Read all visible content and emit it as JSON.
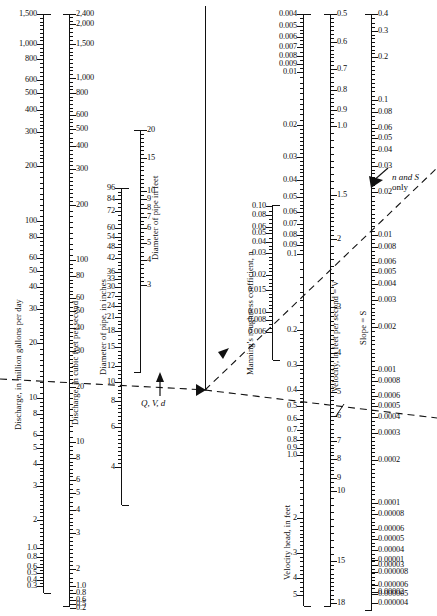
{
  "figure": {
    "type": "nomograph"
  },
  "pivot_line": {
    "x": 205,
    "y_top": 6,
    "y_bottom": 390
  },
  "annotations": [
    {
      "name": "qvd-label",
      "text": "Q, V, d",
      "x": 141,
      "y": 400
    },
    {
      "name": "n-and-s-label",
      "line1": "n and S",
      "line2": "only",
      "x": 392,
      "y": 178
    }
  ],
  "axes": [
    {
      "id": "mgd",
      "title": "Discharge, in million gallons per day",
      "title_x": 13,
      "title_y": 430,
      "x": 43,
      "y_top": 14,
      "y_bottom": 593,
      "label_side": "left",
      "labels": [
        {
          "v": "1,500",
          "y": 14
        },
        {
          "v": "1,000",
          "y": 44
        },
        {
          "v": "800",
          "y": 59
        },
        {
          "v": "600",
          "y": 80
        },
        {
          "v": "500",
          "y": 93
        },
        {
          "v": "400",
          "y": 110
        },
        {
          "v": "300",
          "y": 132
        },
        {
          "v": "200",
          "y": 166
        },
        {
          "v": "100",
          "y": 221
        },
        {
          "v": "80",
          "y": 237
        },
        {
          "v": "60",
          "y": 258
        },
        {
          "v": "50",
          "y": 271
        },
        {
          "v": "40",
          "y": 287
        },
        {
          "v": "30",
          "y": 309
        },
        {
          "v": "20",
          "y": 343
        },
        {
          "v": "10",
          "y": 398
        },
        {
          "v": "8",
          "y": 414
        },
        {
          "v": "6",
          "y": 435
        },
        {
          "v": "5",
          "y": 448
        },
        {
          "v": "4",
          "y": 464
        },
        {
          "v": "3",
          "y": 486
        },
        {
          "v": "2",
          "y": 520
        },
        {
          "v": "1.0",
          "y": 548
        },
        {
          "v": "0.8",
          "y": 557
        },
        {
          "v": "0.6",
          "y": 567
        },
        {
          "v": "0.5",
          "y": 573
        },
        {
          "v": "0.4",
          "y": 580
        },
        {
          "v": "0.3",
          "y": 586
        },
        {
          "v": "0.2",
          "y": 597
        },
        {
          "v": "0.13",
          "y": 606
        }
      ]
    },
    {
      "id": "cfs",
      "title": "Discharge, in cubic feet per second",
      "title_x": 70,
      "title_y": 425,
      "x": 69,
      "y_top": 14,
      "y_bottom": 606,
      "label_side": "right",
      "labels": [
        {
          "v": "2,400",
          "y": 14
        },
        {
          "v": "2,000",
          "y": 24
        },
        {
          "v": "1,500",
          "y": 44
        },
        {
          "v": "1,000",
          "y": 78
        },
        {
          "v": "800",
          "y": 93
        },
        {
          "v": "600",
          "y": 115
        },
        {
          "v": "500",
          "y": 129
        },
        {
          "v": "400",
          "y": 146
        },
        {
          "v": "300",
          "y": 169
        },
        {
          "v": "200",
          "y": 205
        },
        {
          "v": "100",
          "y": 260
        },
        {
          "v": "80",
          "y": 276
        },
        {
          "v": "60",
          "y": 298
        },
        {
          "v": "50",
          "y": 311
        },
        {
          "v": "40",
          "y": 328
        },
        {
          "v": "30",
          "y": 351
        },
        {
          "v": "20",
          "y": 387
        },
        {
          "v": "10",
          "y": 442
        },
        {
          "v": "8",
          "y": 458
        },
        {
          "v": "6",
          "y": 480
        },
        {
          "v": "5",
          "y": 493
        },
        {
          "v": "4",
          "y": 510
        },
        {
          "v": "3",
          "y": 533
        },
        {
          "v": "2",
          "y": 569
        },
        {
          "v": "1.0",
          "y": 586
        },
        {
          "v": "0.8",
          "y": 593
        },
        {
          "v": "0.6",
          "y": 600
        },
        {
          "v": "0.5",
          "y": 604
        },
        {
          "v": "0.4",
          "y": 609
        },
        {
          "v": "0.3",
          "y": 613
        },
        {
          "v": "0.2",
          "y": 608
        }
      ]
    },
    {
      "id": "d-inches",
      "title": "Diameter of pipe, in inches",
      "title_x": 98,
      "title_y": 375,
      "x": 121,
      "y_top": 188,
      "y_bottom": 505,
      "label_side": "left",
      "labels": [
        {
          "v": "96",
          "y": 188
        },
        {
          "v": "84",
          "y": 199
        },
        {
          "v": "96b",
          "y": 0
        },
        {
          "v": "72",
          "y": 211
        },
        {
          "v": "60",
          "y": 228
        },
        {
          "v": "54",
          "y": 237
        },
        {
          "v": "48",
          "y": 247
        },
        {
          "v": "42",
          "y": 258
        },
        {
          "v": "36",
          "y": 272
        },
        {
          "v": "33",
          "y": 279
        },
        {
          "v": "30",
          "y": 287
        },
        {
          "v": "27",
          "y": 296
        },
        {
          "v": "24",
          "y": 306
        },
        {
          "v": "21",
          "y": 317
        },
        {
          "v": "18",
          "y": 331
        },
        {
          "v": "15",
          "y": 347
        },
        {
          "v": "12",
          "y": 366
        },
        {
          "v": "10",
          "y": 382
        },
        {
          "v": "8",
          "y": 401
        },
        {
          "v": "6",
          "y": 427
        },
        {
          "v": "4",
          "y": 467
        }
      ]
    },
    {
      "id": "d-feet",
      "title": "Diameter of pipe in feet",
      "title_x": 150,
      "title_y": 260,
      "x": 140,
      "y_top": 130,
      "y_bottom": 372,
      "label_side": "right",
      "labels": [
        {
          "v": "20",
          "y": 130
        },
        {
          "v": "15",
          "y": 158
        },
        {
          "v": "10",
          "y": 191
        },
        {
          "v": "9",
          "y": 199
        },
        {
          "v": "8",
          "y": 208
        },
        {
          "v": "7",
          "y": 217
        },
        {
          "v": "6",
          "y": 228
        },
        {
          "v": "5",
          "y": 243
        },
        {
          "v": "4",
          "y": 260
        },
        {
          "v": "3",
          "y": 285
        }
      ]
    },
    {
      "id": "manning-n",
      "title": "Manning's roughness coefficient, n",
      "title_x": 245,
      "title_y": 375,
      "x": 272,
      "y_top": 205,
      "y_bottom": 360,
      "label_side": "left",
      "labels": [
        {
          "v": "0.10",
          "y": 206
        },
        {
          "v": "0.08",
          "y": 215
        },
        {
          "v": "0.06",
          "y": 227
        },
        {
          "v": "0.05",
          "y": 233
        },
        {
          "v": "0.04",
          "y": 242
        },
        {
          "v": "0.03",
          "y": 253
        },
        {
          "v": "0.02",
          "y": 275
        },
        {
          "v": "0.015",
          "y": 290
        },
        {
          "v": "0.010",
          "y": 312
        },
        {
          "v": "0.008",
          "y": 320
        },
        {
          "v": "0.006",
          "y": 332
        }
      ]
    },
    {
      "id": "velocity-head",
      "title": "Velocity head, in feet",
      "title_x": 282,
      "title_y": 580,
      "x": 303,
      "y_top": 14,
      "y_bottom": 606,
      "label_side": "left",
      "labels": [
        {
          "v": "0.004",
          "y": 14
        },
        {
          "v": "0.005",
          "y": 26
        },
        {
          "v": "0.006",
          "y": 37
        },
        {
          "v": "0.007",
          "y": 47
        },
        {
          "v": "0.008",
          "y": 56
        },
        {
          "v": "0.009",
          "y": 64
        },
        {
          "v": "0.01",
          "y": 72
        },
        {
          "v": "0.02",
          "y": 125
        },
        {
          "v": "0.03",
          "y": 157
        },
        {
          "v": "0.04",
          "y": 180
        },
        {
          "v": "0.05",
          "y": 197
        },
        {
          "v": "0.06",
          "y": 212
        },
        {
          "v": "0.07",
          "y": 224
        },
        {
          "v": "0.08",
          "y": 235
        },
        {
          "v": "0.09",
          "y": 245
        },
        {
          "v": "0.1",
          "y": 254
        },
        {
          "v": "0.2",
          "y": 330
        },
        {
          "v": "0.3",
          "y": 365
        },
        {
          "v": "0.4",
          "y": 390
        },
        {
          "v": "0.5",
          "y": 406
        },
        {
          "v": "0.6",
          "y": 419
        },
        {
          "v": "0.7",
          "y": 430
        },
        {
          "v": "0.8",
          "y": 440
        },
        {
          "v": "0.9",
          "y": 448
        },
        {
          "v": "1.0",
          "y": 455
        },
        {
          "v": "2",
          "y": 518
        },
        {
          "v": "3",
          "y": 553
        },
        {
          "v": "4",
          "y": 578
        },
        {
          "v": "5",
          "y": 595
        }
      ]
    },
    {
      "id": "velocity",
      "title": "Velocity, in feet per second = V",
      "title_x": 330,
      "title_y": 392,
      "x": 330,
      "y_top": 14,
      "y_bottom": 606,
      "label_side": "right",
      "labels": [
        {
          "v": "0.5",
          "y": 14
        },
        {
          "v": "0.6",
          "y": 42
        },
        {
          "v": "0.7",
          "y": 69
        },
        {
          "v": "0.8",
          "y": 90
        },
        {
          "v": "0.9",
          "y": 110
        },
        {
          "v": "1.0",
          "y": 126
        },
        {
          "v": "1.5",
          "y": 195
        },
        {
          "v": "2",
          "y": 239
        },
        {
          "v": "3",
          "y": 307
        },
        {
          "v": "4",
          "y": 353
        },
        {
          "v": "5",
          "y": 392
        },
        {
          "v": "6",
          "y": 416
        },
        {
          "v": "7",
          "y": 441
        },
        {
          "v": "8",
          "y": 459
        },
        {
          "v": "9",
          "y": 478
        },
        {
          "v": "10",
          "y": 491
        },
        {
          "v": "15",
          "y": 561
        },
        {
          "v": "18",
          "y": 603
        }
      ]
    },
    {
      "id": "slope",
      "title": "Slope = S",
      "title_x": 358,
      "title_y": 345,
      "x": 371,
      "y_top": 14,
      "y_bottom": 610,
      "label_side": "right",
      "labels": [
        {
          "v": "0.4",
          "y": 14
        },
        {
          "v": "0.3",
          "y": 31
        },
        {
          "v": "0.2",
          "y": 57
        },
        {
          "v": "0.1",
          "y": 100
        },
        {
          "v": "0.08",
          "y": 112
        },
        {
          "v": "0.06",
          "y": 128
        },
        {
          "v": "0.05",
          "y": 138
        },
        {
          "v": "0.04",
          "y": 150
        },
        {
          "v": "0.03",
          "y": 166
        },
        {
          "v": "0.02",
          "y": 192
        },
        {
          "v": "0.01",
          "y": 235
        },
        {
          "v": "0.008",
          "y": 247
        },
        {
          "v": "0.006",
          "y": 262
        },
        {
          "v": "0.005",
          "y": 272
        },
        {
          "v": "0.004",
          "y": 284
        },
        {
          "v": "0.003",
          "y": 300
        },
        {
          "v": "0.002",
          "y": 327
        },
        {
          "v": "0.001",
          "y": 370
        },
        {
          "v": "0.0008",
          "y": 381
        },
        {
          "v": "0.0006",
          "y": 396
        },
        {
          "v": "0.0005",
          "y": 406
        },
        {
          "v": "0.0004",
          "y": 417
        },
        {
          "v": "0.0003",
          "y": 433
        },
        {
          "v": "0.0002",
          "y": 460
        },
        {
          "v": "0.0001",
          "y": 503
        },
        {
          "v": "0.00008",
          "y": 514
        },
        {
          "v": "0.00006",
          "y": 529
        },
        {
          "v": "0.00005",
          "y": 539
        },
        {
          "v": "0.00004",
          "y": 550
        },
        {
          "v": "0.00003",
          "y": 565
        },
        {
          "v": "0.00002",
          "y": 592
        },
        {
          "v": "0.00001",
          "y": 635
        },
        {
          "v": "0.000008",
          "y": 646
        },
        {
          "v": "0.000006",
          "y": 661
        },
        {
          "v": "0.000005",
          "y": 671
        },
        {
          "v": "0.000004",
          "y": 682
        }
      ]
    }
  ],
  "slope_labels_extra": [
    {
      "v": "0.00001",
      "y": 560
    },
    {
      "v": "0.000008",
      "y": 572
    },
    {
      "v": "0.000006",
      "y": 585
    },
    {
      "v": "0.000005",
      "y": 594
    },
    {
      "v": "0.000004",
      "y": 603
    }
  ],
  "chart_data": {
    "type": "nomograph",
    "scales": [
      {
        "name": "Discharge, in million gallons per day",
        "unit": "mgd",
        "min": 0.13,
        "max": 1500
      },
      {
        "name": "Discharge, in cubic feet per second",
        "unit": "cfs",
        "min": 0.2,
        "max": 2400
      },
      {
        "name": "Diameter of pipe, in inches",
        "unit": "in",
        "min": 4,
        "max": 96
      },
      {
        "name": "Diameter of pipe in feet",
        "unit": "ft",
        "min": 3,
        "max": 20
      },
      {
        "name": "Manning's roughness coefficient, n",
        "unit": "",
        "min": 0.006,
        "max": 0.1
      },
      {
        "name": "Velocity head, in feet",
        "unit": "ft",
        "min": 0.004,
        "max": 5
      },
      {
        "name": "Velocity, in feet per second = V",
        "unit": "ft/s",
        "min": 0.5,
        "max": 18
      },
      {
        "name": "Slope = S",
        "unit": "",
        "min": 4e-06,
        "max": 0.4
      }
    ],
    "construction_lines": [
      {
        "name": "left-isopleth",
        "from": [
          0,
          382
        ],
        "to": [
          205,
          390
        ],
        "style": "dashed"
      },
      {
        "name": "right-isopleth",
        "from": [
          205,
          390
        ],
        "to": [
          437,
          418
        ],
        "style": "dashed"
      },
      {
        "name": "n-s-isopleth",
        "from": [
          205,
          390
        ],
        "to": [
          437,
          170
        ],
        "style": "dashed"
      }
    ]
  }
}
